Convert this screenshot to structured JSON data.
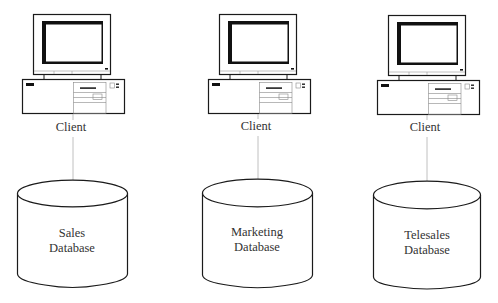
{
  "diagram": {
    "type": "client-database architecture",
    "colors": {
      "stroke": "#1a1a1a",
      "connector": "#b0b0b0",
      "text": "#333333",
      "background": "#ffffff"
    },
    "nodes": [
      {
        "client": {
          "label": "Client",
          "icon": "desktop-computer-icon"
        },
        "database": {
          "line1": "Sales",
          "line2": "Database",
          "icon": "database-cylinder-icon"
        }
      },
      {
        "client": {
          "label": "Client",
          "icon": "desktop-computer-icon"
        },
        "database": {
          "line1": "Marketing",
          "line2": "Database",
          "icon": "database-cylinder-icon"
        }
      },
      {
        "client": {
          "label": "Client",
          "icon": "desktop-computer-icon"
        },
        "database": {
          "line1": "Telesales",
          "line2": "Database",
          "icon": "database-cylinder-icon"
        }
      }
    ]
  }
}
